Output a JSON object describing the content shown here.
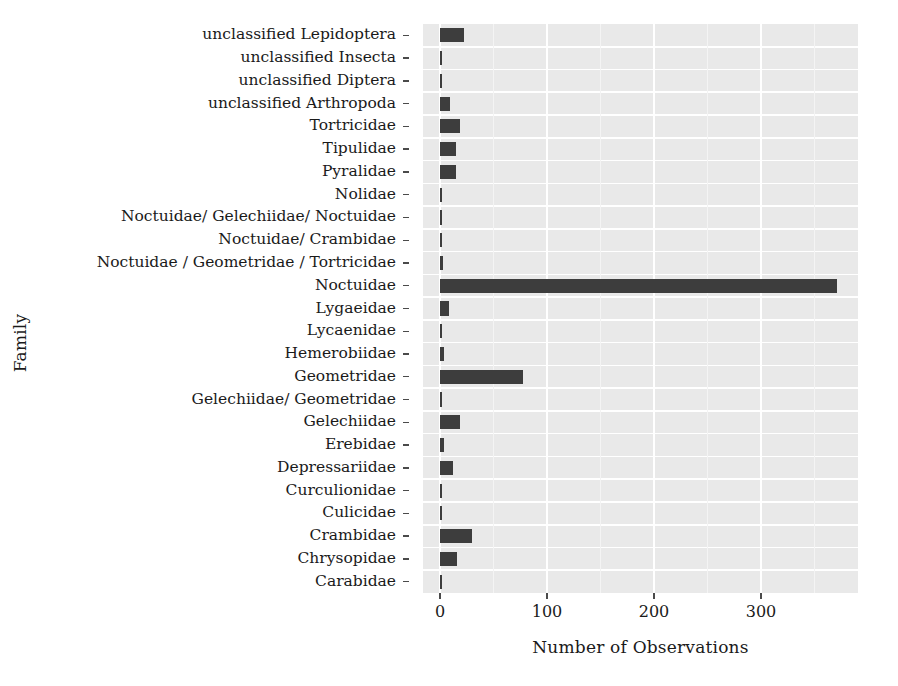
{
  "chart_data": {
    "type": "bar",
    "orientation": "horizontal",
    "title": "",
    "xlabel": "Number of Observations",
    "ylabel": "Family",
    "xlim": [
      -5,
      400
    ],
    "ylim": null,
    "grid": true,
    "grid_color": "#ffffff",
    "panel_background": "#e9e9e9",
    "bar_color": "#3d3d3d",
    "legend": null,
    "xticks": [
      0,
      100,
      200,
      300
    ],
    "xtick_labels": [
      "0",
      "100",
      "200",
      "300"
    ],
    "categories": [
      "unclassified Lepidoptera",
      "unclassified Insecta",
      "unclassified Diptera",
      "unclassified Arthropoda",
      "Tortricidae",
      "Tipulidae",
      "Pyralidae",
      "Nolidae",
      "Noctuidae/ Gelechiidae/ Noctuidae",
      "Noctuidae/ Crambidae",
      "Noctuidae / Geometridae / Tortricidae",
      "Noctuidae",
      "Lygaeidae",
      "Lycaenidae",
      "Hemerobiidae",
      "Geometridae",
      "Gelechiidae/ Geometridae",
      "Gelechiidae",
      "Erebidae",
      "Depressariidae",
      "Curculionidae",
      "Culicidae",
      "Crambidae",
      "Chrysopidae",
      "Carabidae"
    ],
    "values": [
      22,
      2,
      2,
      9,
      19,
      15,
      15,
      2,
      2,
      2,
      3,
      371,
      8,
      2,
      4,
      78,
      2,
      19,
      4,
      12,
      2,
      2,
      30,
      16,
      2
    ]
  }
}
